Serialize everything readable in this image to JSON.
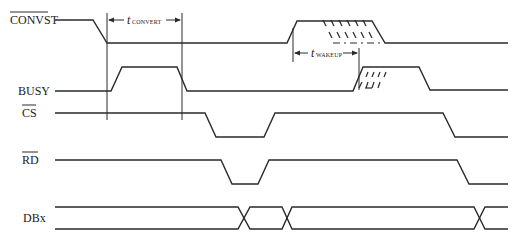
{
  "diagram": {
    "colors": {
      "stroke": "#2a2a2a",
      "background": "#ffffff"
    },
    "signals": [
      {
        "name": "CONVST",
        "overbar": true,
        "label_x": 10,
        "label_y": 24
      },
      {
        "name": "BUSY",
        "overbar": false,
        "label_x": 18,
        "label_y": 95
      },
      {
        "name": "CS",
        "overbar": true,
        "label_x": 22,
        "label_y": 117
      },
      {
        "name": "RD",
        "overbar": true,
        "label_x": 22,
        "label_y": 164
      },
      {
        "name": "DBx",
        "overbar": false,
        "label_x": 23,
        "label_y": 222
      }
    ],
    "timing_labels": {
      "convert": {
        "main": "t",
        "sub": "CONVERT"
      },
      "wakeup": {
        "main": "t",
        "sub": "WAKEUP"
      }
    }
  }
}
